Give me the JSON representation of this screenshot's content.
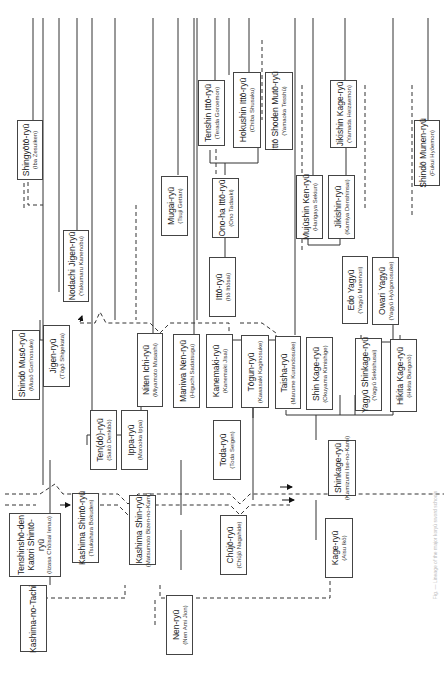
{
  "diagram": {
    "orientation": "rotated 90° counter-clockwise",
    "nodes": [
      {
        "id": "kashima-no-tachi",
        "name": "Kashima-no-Tachi",
        "founder": ""
      },
      {
        "id": "tenshinsho-den-katori",
        "name": "Tenshinshō-den Katori Shintō-ryū",
        "founder": "(Iizasa Chōisai Ienao)"
      },
      {
        "id": "kashima-shinto",
        "name": "Kashima Shintō-ryū",
        "founder": "(Tsukahara Bokuden)"
      },
      {
        "id": "kashima-shin",
        "name": "Kashima Shin-ryū",
        "founder": "(Matsumoto Bizen-no-Kami)"
      },
      {
        "id": "nen",
        "name": "Nen-ryū",
        "founder": "(Nen Ami Jion)"
      },
      {
        "id": "chujo",
        "name": "Chūjō-ryū",
        "founder": "(Chūjō Nagahide)"
      },
      {
        "id": "kage",
        "name": "Kage-ryū",
        "founder": "(Aisu Ikō)"
      },
      {
        "id": "shinkage",
        "name": "Shinkage-ryū",
        "founder": "(Kamizumi Ise-no-Kami)"
      },
      {
        "id": "shinto-muso",
        "name": "Shindō Musō-ryū",
        "founder": "(Musō Gon'nosuke)"
      },
      {
        "id": "jigen",
        "name": "Jigen-ryū",
        "founder": "(Tōgō Shigekata)"
      },
      {
        "id": "nodachi-jigen",
        "name": "Nodachi Jigen-ryū",
        "founder": "(Yakumaru Kanenobu)"
      },
      {
        "id": "shingyoto",
        "name": "Shingyōtō-ryū",
        "founder": "(Iba Zesuiken)"
      },
      {
        "id": "tendo",
        "name": "Ten(dō)-ryū",
        "founder": "(Saitō Denkibō)"
      },
      {
        "id": "ippa",
        "name": "Ippa-ryū",
        "founder": "(Morooka Ippa)"
      },
      {
        "id": "niten-ichi",
        "name": "Niten Ichi-ryū",
        "founder": "(Miyamoto Musashi)"
      },
      {
        "id": "maniwa-nen",
        "name": "Maniwa Nen-ryū",
        "founder": "(Higuchi Sadatsugu)"
      },
      {
        "id": "kanemaki",
        "name": "Kanemaki-ryū",
        "founder": "(Kanemaki Jisai)"
      },
      {
        "id": "toda",
        "name": "Toda-ryū",
        "founder": "(Toda Seigen)"
      },
      {
        "id": "togun",
        "name": "Tōgun-ryū",
        "founder": "(Kawasaki Kaginosuke)"
      },
      {
        "id": "taisha",
        "name": "Taisha-ryū",
        "founder": "(Marume Kurandosuke)"
      },
      {
        "id": "itto",
        "name": "Ittō-ryū",
        "founder": "(Itō Ittōsai)"
      },
      {
        "id": "ono-ha-itto",
        "name": "Ono-ha Ittō-ryū",
        "founder": "(Ono Tadaaki)"
      },
      {
        "id": "mugai",
        "name": "Mugai-ryū",
        "founder": "(Tsuji Gettan)"
      },
      {
        "id": "tenshin-itto",
        "name": "Tenshin Ittō-ryū",
        "founder": "(Terada Goroemon)"
      },
      {
        "id": "hokushin-itto",
        "name": "Hokushin Ittō-ryū",
        "founder": "(Chiba Shusaku)"
      },
      {
        "id": "itto-shoden-muto",
        "name": "Ittō Shoden Mutō-ryū",
        "founder": "(Yamaoka Tesshū)"
      },
      {
        "id": "shin-kage",
        "name": "Shin Kage-ryū",
        "founder": "(Okuyama Kimishige)"
      },
      {
        "id": "mujushin-ken",
        "name": "Mujūshin Ken-ryū",
        "founder": "(Harigaya Sekiun)"
      },
      {
        "id": "jikishin",
        "name": "Jikishin-ryū",
        "founder": "(Kamiya Denshinsai)"
      },
      {
        "id": "jikishin-kage",
        "name": "Jikishin Kage-ryū",
        "founder": "(Yamada Heizaemon)"
      },
      {
        "id": "yagyu-shinkage",
        "name": "Yagyū Shinkage-ryū",
        "founder": "(Yagyū Sekishusai)"
      },
      {
        "id": "edo-yagyu",
        "name": "Edo Yagyū",
        "founder": "(Yagyū Munenori)"
      },
      {
        "id": "owari-yagyu",
        "name": "Owari Yagyū",
        "founder": "(Yagyū Hyōgonosuke)"
      },
      {
        "id": "hikita-kage",
        "name": "Hikita Kage-ryū",
        "founder": "(Hikita Bungorō)"
      },
      {
        "id": "shinto-munen",
        "name": "Shindō Munen-ryū",
        "founder": "(Fukui Hyōemon)"
      }
    ],
    "caption": "Fig. — Lineage of the major koryū sword schools"
  }
}
